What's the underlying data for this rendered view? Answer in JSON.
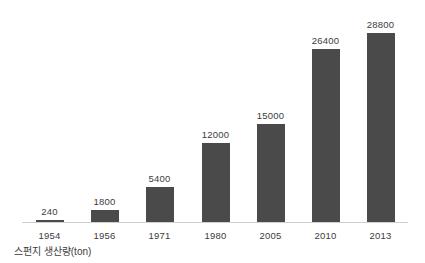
{
  "chart_data": {
    "type": "bar",
    "title": "",
    "subtitle": "",
    "caption": "스펀지 생산량(ton)",
    "xlabel": "",
    "ylabel": "",
    "categories": [
      "1954",
      "1956",
      "1971",
      "1980",
      "2005",
      "2010",
      "2013"
    ],
    "values": [
      240,
      1800,
      5400,
      12000,
      15000,
      26400,
      28800
    ],
    "value_labels": [
      "240",
      "1800",
      "5400",
      "12000",
      "15000",
      "26400",
      "28800"
    ],
    "series": [
      {
        "name": "스펀지 생산량(ton)",
        "values": [
          240,
          1800,
          5400,
          12000,
          15000,
          26400,
          28800
        ]
      }
    ],
    "ylim": [
      0,
      28800
    ],
    "grid": false,
    "legend": false,
    "legend_position": "none",
    "data_labels": true,
    "axis_visible": {
      "x": true,
      "y": false
    },
    "colors": {
      "bar": "#4a4a4a",
      "text": "#3c3c3c",
      "axis": "#cfcfcf",
      "background": "#ffffff"
    }
  }
}
